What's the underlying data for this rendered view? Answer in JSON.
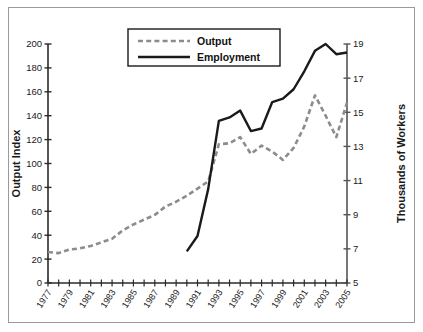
{
  "chart_data": {
    "type": "line",
    "title": "",
    "xlabel": "",
    "x": [
      1977,
      1978,
      1979,
      1980,
      1981,
      1982,
      1983,
      1984,
      1985,
      1986,
      1987,
      1988,
      1989,
      1990,
      1991,
      1992,
      1993,
      1994,
      1995,
      1996,
      1997,
      1998,
      1999,
      2000,
      2001,
      2002,
      2003,
      2004,
      2005
    ],
    "xtick_labels": [
      "1977",
      "1979",
      "1981",
      "1983",
      "1985",
      "1987",
      "1989",
      "1991",
      "1993",
      "1995",
      "1997",
      "1999",
      "2001",
      "2003",
      "2005"
    ],
    "xtick_values": [
      1977,
      1979,
      1981,
      1983,
      1985,
      1987,
      1989,
      1991,
      1993,
      1995,
      1997,
      1999,
      2001,
      2003,
      2005
    ],
    "xlim": [
      1977,
      2005
    ],
    "grid": false,
    "legend_position": "top-center",
    "left_axis": {
      "label": "Output Index",
      "ylim": [
        0,
        200
      ],
      "ticks": [
        0,
        20,
        40,
        60,
        80,
        100,
        120,
        140,
        160,
        180,
        200
      ],
      "tick_labels": [
        "0",
        "20",
        "40",
        "60",
        "80",
        "100",
        "120",
        "140",
        "160",
        "180",
        "200"
      ]
    },
    "right_axis": {
      "label": "Thousands of Workers",
      "ylim": [
        5,
        19
      ],
      "ticks": [
        5,
        7,
        9,
        11,
        13,
        15,
        17,
        19
      ],
      "tick_labels": [
        "5",
        "7",
        "9",
        "11",
        "13",
        "15",
        "17",
        "19"
      ]
    },
    "series": [
      {
        "name": "Output",
        "axis": "left",
        "style": "dashed",
        "color": "#8c8c8c",
        "x": [
          1977,
          1978,
          1979,
          1980,
          1981,
          1982,
          1983,
          1984,
          1985,
          1986,
          1987,
          1988,
          1989,
          1990,
          1991,
          1992,
          1993,
          1994,
          1995,
          1996,
          1997,
          1998,
          1999,
          2000,
          2001,
          2002,
          2003,
          2004,
          2005
        ],
        "values": [
          26,
          25,
          28,
          29,
          31,
          34,
          37,
          44,
          49,
          53,
          57,
          64,
          68,
          73,
          79,
          85,
          116,
          117,
          122,
          108,
          115,
          110,
          103,
          113,
          131,
          157,
          140,
          122,
          151
        ]
      },
      {
        "name": "Employment",
        "axis": "right",
        "style": "solid",
        "color": "#1a1a1a",
        "x": [
          1990,
          1991,
          1992,
          1993,
          1994,
          1995,
          1996,
          1997,
          1998,
          1999,
          2000,
          2001,
          2002,
          2003,
          2004,
          2005
        ],
        "values": [
          6.85,
          7.75,
          10.5,
          14.5,
          14.7,
          15.1,
          13.9,
          14.05,
          15.6,
          15.8,
          16.35,
          17.4,
          18.6,
          19.0,
          18.4,
          18.5
        ]
      }
    ]
  },
  "legend": {
    "entries": [
      {
        "label": "Output",
        "style": "dashed",
        "color": "#8c8c8c"
      },
      {
        "label": "Employment",
        "style": "solid",
        "color": "#1a1a1a"
      }
    ]
  }
}
